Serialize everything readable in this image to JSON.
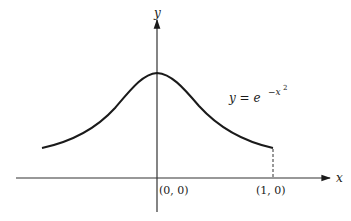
{
  "diagram": {
    "axes": {
      "x_label": "x",
      "y_label": "y"
    },
    "curve_label": {
      "lhs": "y",
      "eq": " = ",
      "base": "e",
      "exp_sign": "−",
      "exp_var": "x",
      "exp_pow": "2"
    },
    "points": [
      {
        "label": "(0, 0)"
      },
      {
        "label": "(1, 0)"
      }
    ],
    "colors": {
      "ink": "#1a1a1a",
      "axis": "#333333",
      "background": "#ffffff"
    }
  }
}
